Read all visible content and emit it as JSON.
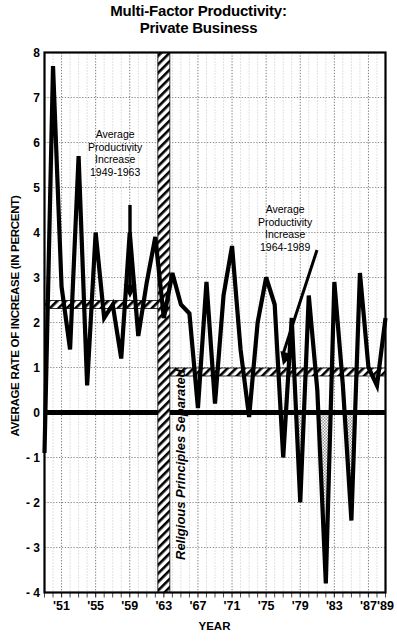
{
  "chart_data": {
    "type": "line",
    "title": "Multi-Factor Productivity:\nPrivate Business",
    "title_line1": "Multi-Factor Productivity:",
    "title_line2": "Private Business",
    "xlabel": "YEAR",
    "ylabel": "AVERAGE RATE OF INCREASE (IN PERCENT)",
    "ylim": [
      -4,
      8
    ],
    "xlim": [
      1949,
      1989
    ],
    "ytick_labels": [
      "8",
      "7",
      "6",
      "5",
      "4",
      "3",
      "2",
      "1",
      "0",
      "- 1",
      "- 2",
      "- 3",
      "- 4"
    ],
    "ytick_values": [
      8,
      7,
      6,
      5,
      4,
      3,
      2,
      1,
      0,
      -1,
      -2,
      -3,
      -4
    ],
    "xtick_labels": [
      "'51",
      "'55",
      "'59",
      "'63",
      "'67",
      "'71",
      "'75",
      "'79",
      "'83",
      "'87",
      "'89"
    ],
    "xtick_values": [
      1951,
      1955,
      1959,
      1963,
      1967,
      1971,
      1975,
      1979,
      1983,
      1987,
      1989
    ],
    "grid": true,
    "legend": "none",
    "x": [
      1949,
      1950,
      1951,
      1952,
      1953,
      1954,
      1955,
      1956,
      1957,
      1958,
      1959,
      1960,
      1961,
      1962,
      1963,
      1964,
      1965,
      1966,
      1967,
      1968,
      1969,
      1970,
      1971,
      1972,
      1973,
      1974,
      1975,
      1976,
      1977,
      1978,
      1979,
      1980,
      1981,
      1982,
      1983,
      1984,
      1985,
      1986,
      1987,
      1988,
      1989
    ],
    "values": [
      -0.9,
      7.7,
      2.8,
      1.4,
      5.7,
      0.6,
      4.0,
      2.1,
      2.4,
      1.2,
      4.0,
      1.7,
      2.9,
      3.9,
      2.1,
      3.1,
      2.4,
      2.2,
      0.1,
      2.9,
      0.2,
      2.6,
      3.7,
      1.4,
      -0.1,
      2.0,
      3.0,
      2.4,
      -1.0,
      2.1,
      -2.0,
      2.6,
      0.5,
      -3.8,
      2.9,
      0.6,
      -2.4,
      3.1,
      1.0,
      0.6,
      2.1
    ],
    "series_name": "Multi-factor productivity growth",
    "reference_bands": [
      {
        "name": "Average Productivity Increase 1949-1963",
        "value": 2.4,
        "x_start": 1949,
        "x_end": 1963,
        "style": "hatched"
      },
      {
        "name": "Average Productivity Increase 1964-1989",
        "value": 0.9,
        "x_start": 1963,
        "x_end": 1989,
        "style": "hatched"
      }
    ],
    "annotations": [
      {
        "id": "annot-1949-1963",
        "lines": [
          "Average",
          "Productivity",
          "Increase",
          "1949-1963"
        ],
        "arrow": "down",
        "points_to_value": 2.4,
        "points_to_year": 1956.5
      },
      {
        "id": "annot-1964-1989",
        "lines": [
          "Average",
          "Productivity",
          "Increase",
          "1964-1989"
        ],
        "arrow": "down",
        "points_to_value": 0.9,
        "points_to_year": 1979.5
      }
    ],
    "vertical_divider": {
      "label": "Religious Principles Separated",
      "year": 1963,
      "style": "hatched-band"
    },
    "colors": {
      "line": "#000000",
      "axis": "#000000",
      "grid": "#808080",
      "background": "#ffffff",
      "shaded_negative": "#b0b0b0"
    }
  }
}
